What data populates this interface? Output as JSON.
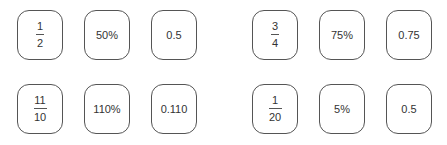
{
  "groups": [
    {
      "row": 1,
      "side": "left",
      "fraction": {
        "numerator": "1",
        "denominator": "2"
      },
      "percent": "50%",
      "decimal": "0.5"
    },
    {
      "row": 1,
      "side": "right",
      "fraction": {
        "numerator": "3",
        "denominator": "4"
      },
      "percent": "75%",
      "decimal": "0.75"
    },
    {
      "row": 2,
      "side": "left",
      "fraction": {
        "numerator": "11",
        "denominator": "10"
      },
      "percent": "110%",
      "decimal": "0.110"
    },
    {
      "row": 2,
      "side": "right",
      "fraction": {
        "numerator": "1",
        "denominator": "20"
      },
      "percent": "5%",
      "decimal": "0.5"
    }
  ],
  "colors": {
    "border": "#555555",
    "text": "#333333",
    "background": "#ffffff"
  }
}
